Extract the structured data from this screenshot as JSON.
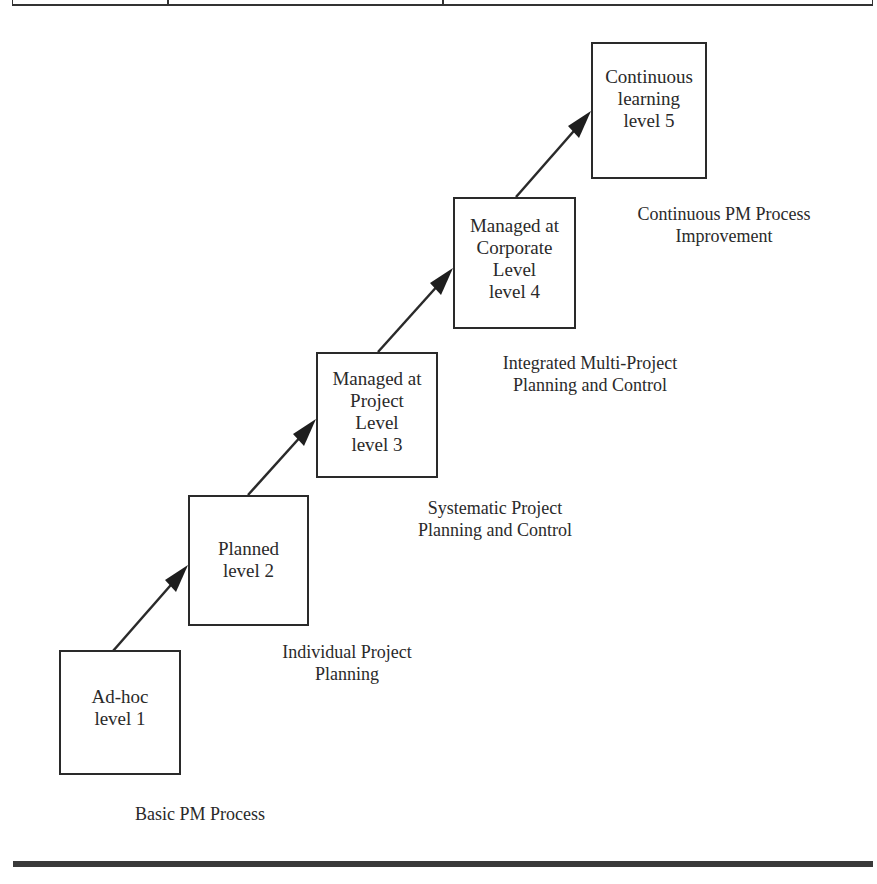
{
  "diagram": {
    "type": "staircase maturity model",
    "levels": [
      {
        "id": 1,
        "lines": [
          "Ad-hoc",
          "level 1"
        ],
        "caption": [
          "Basic PM Process"
        ]
      },
      {
        "id": 2,
        "lines": [
          "Planned",
          "level 2"
        ],
        "caption": [
          "Individual Project",
          "Planning"
        ]
      },
      {
        "id": 3,
        "lines": [
          "Managed at",
          "Project",
          "Level",
          "level 3"
        ],
        "caption": [
          "Systematic Project",
          "Planning and Control"
        ]
      },
      {
        "id": 4,
        "lines": [
          "Managed at",
          "Corporate",
          "Level",
          "level 4"
        ],
        "caption": [
          "Integrated Multi-Project",
          "Planning and Control"
        ]
      },
      {
        "id": 5,
        "lines": [
          "Continuous",
          "learning",
          "level 5"
        ],
        "caption": [
          "Continuous PM Process",
          "Improvement"
        ]
      }
    ],
    "connectors": [
      {
        "from": 1,
        "to": 2
      },
      {
        "from": 2,
        "to": 3
      },
      {
        "from": 3,
        "to": 4
      },
      {
        "from": 4,
        "to": 5
      }
    ]
  }
}
